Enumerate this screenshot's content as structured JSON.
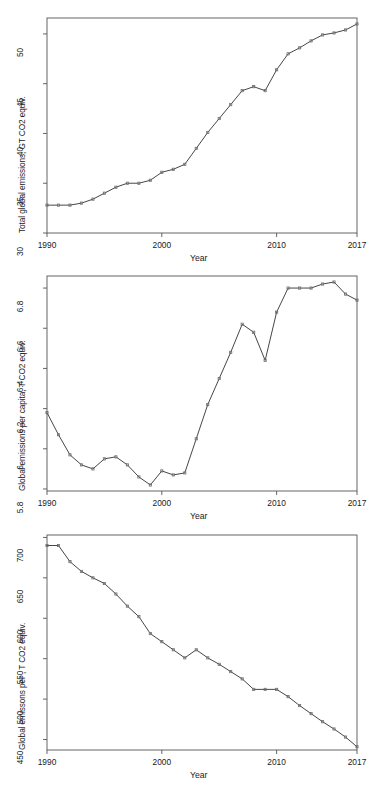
{
  "figure": {
    "background": "#ffffff",
    "line_color": "#3c3c3c",
    "marker_color": "#6e6e6e",
    "frame_color": "#555555",
    "panel_count": 3
  },
  "chart_data": [
    {
      "type": "line",
      "title": "",
      "xlabel": "Year",
      "ylabel": "Total global emissions, GT CO2 equiv.",
      "xlim": [
        1990,
        2017
      ],
      "ylim": [
        30,
        51.6
      ],
      "grid": false,
      "legend": "none",
      "xticks": [
        1990,
        2000,
        2010,
        2017
      ],
      "xtick_labels": [
        "1990",
        "2000",
        "2010",
        "2017"
      ],
      "yticks": [
        30,
        35,
        40,
        45,
        50
      ],
      "ytick_labels": [
        "30",
        "35",
        "40",
        "45",
        "50"
      ],
      "x": [
        1990,
        1991,
        1992,
        1993,
        1994,
        1995,
        1996,
        1997,
        1998,
        1999,
        2000,
        2001,
        2002,
        2003,
        2004,
        2005,
        2006,
        2007,
        2008,
        2009,
        2010,
        2011,
        2012,
        2013,
        2014,
        2015,
        2016,
        2017
      ],
      "values": [
        32.8,
        32.8,
        32.8,
        33.0,
        33.4,
        34.0,
        34.6,
        35.0,
        35.0,
        35.3,
        36.1,
        36.4,
        36.9,
        38.5,
        40.1,
        41.5,
        42.9,
        44.3,
        44.7,
        44.3,
        46.4,
        48.0,
        48.6,
        49.3,
        49.9,
        50.1,
        50.4,
        51.0
      ]
    },
    {
      "type": "line",
      "title": "",
      "xlabel": "Year",
      "ylabel": "Global emissions per capita, T CO2 equiv.",
      "xlim": [
        1990,
        2017
      ],
      "ylim": [
        5.79,
        6.86
      ],
      "grid": false,
      "legend": "none",
      "xticks": [
        1990,
        2000,
        2010,
        2017
      ],
      "xtick_labels": [
        "1990",
        "2000",
        "2010",
        "2017"
      ],
      "yticks": [
        5.8,
        6.0,
        6.2,
        6.4,
        6.6,
        6.8
      ],
      "ytick_labels": [
        "5.8",
        "6",
        "6.2",
        "6.4",
        "6.6",
        "6.8"
      ],
      "x": [
        1990,
        1991,
        1992,
        1993,
        1994,
        1995,
        1996,
        1997,
        1998,
        1999,
        2000,
        2001,
        2002,
        2003,
        2004,
        2005,
        2006,
        2007,
        2008,
        2009,
        2010,
        2011,
        2012,
        2013,
        2014,
        2015,
        2016,
        2017
      ],
      "values": [
        6.18,
        6.07,
        5.97,
        5.92,
        5.9,
        5.95,
        5.96,
        5.92,
        5.86,
        5.82,
        5.89,
        5.87,
        5.88,
        6.05,
        6.22,
        6.35,
        6.48,
        6.62,
        6.58,
        6.44,
        6.68,
        6.8,
        6.8,
        6.8,
        6.82,
        6.83,
        6.77,
        6.74
      ]
    },
    {
      "type": "line",
      "title": "",
      "xlabel": "Year",
      "ylabel": "Global emissons per , T CO2 equiv.",
      "xlim": [
        1990,
        2017
      ],
      "ylim": [
        437,
        703
      ],
      "grid": false,
      "legend": "none",
      "xticks": [
        1990,
        2000,
        2010,
        2017
      ],
      "xtick_labels": [
        "1990",
        "2000",
        "2010",
        "2017"
      ],
      "yticks": [
        450,
        500,
        550,
        600,
        650,
        700
      ],
      "ytick_labels": [
        "450",
        "500",
        "550",
        "600",
        "650",
        "700"
      ],
      "x": [
        1990,
        1991,
        1992,
        1993,
        1994,
        1995,
        1996,
        1997,
        1998,
        1999,
        2000,
        2001,
        2002,
        2003,
        2004,
        2005,
        2006,
        2007,
        2008,
        2009,
        2010,
        2011,
        2012,
        2013,
        2014,
        2015,
        2016,
        2017
      ],
      "values": [
        690,
        690,
        670,
        658,
        650,
        643,
        630,
        615,
        602,
        581,
        571,
        561,
        551,
        561,
        551,
        543,
        534,
        525,
        512,
        512,
        512,
        503,
        492,
        482,
        472,
        463,
        453,
        441
      ]
    }
  ]
}
